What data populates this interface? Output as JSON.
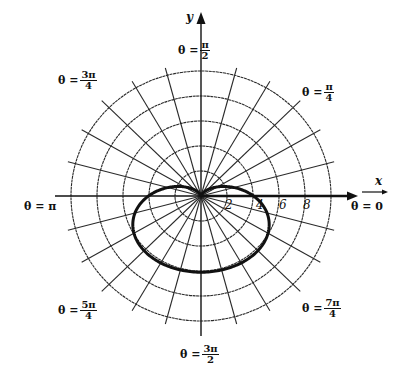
{
  "figure": {
    "type": "polar-graph",
    "axes": {
      "x_label": "x",
      "y_label": "y"
    },
    "radial_ticks": [
      "2",
      "4",
      "6",
      "8"
    ],
    "angle_labels": {
      "deg0": {
        "theta": "θ = 0",
        "prefix": "θ =",
        "num": "0",
        "den": ""
      },
      "deg45": {
        "prefix": "θ =",
        "num": "π",
        "den": "4"
      },
      "deg90": {
        "prefix": "θ =",
        "num": "π",
        "den": "2"
      },
      "deg135": {
        "prefix": "θ =",
        "num": "3π",
        "den": "4"
      },
      "deg180": {
        "theta": "θ = π"
      },
      "deg225": {
        "prefix": "θ =",
        "num": "5π",
        "den": "4"
      },
      "deg270": {
        "prefix": "θ =",
        "num": "3π",
        "den": "2"
      },
      "deg315": {
        "prefix": "θ =",
        "num": "7π",
        "den": "4"
      }
    },
    "colors": {
      "ink": "#111111",
      "grid": "#2a2a2a",
      "background": "#ffffff"
    }
  },
  "chart_data": {
    "type": "line",
    "title": "",
    "coordinate_system": "polar",
    "xlabel": "x",
    "ylabel": "y",
    "radial_grid": [
      2,
      4,
      6,
      8,
      10
    ],
    "radial_tick_labels": [
      "2",
      "4",
      "6",
      "8"
    ],
    "angular_grid_step_deg": 15,
    "angle_labels": [
      "θ = 0",
      "θ = π/4",
      "θ = π/2",
      "θ = 3π/4",
      "θ = π",
      "θ = 5π/4",
      "θ = 3π/2",
      "θ = 7π/4"
    ],
    "series": [
      {
        "name": "cardioid",
        "equation": "r = 3 - 3 sin θ",
        "theta": [
          "0",
          "π/4",
          "π/2",
          "3π/4",
          "π",
          "5π/4",
          "3π/2",
          "7π/4"
        ],
        "r": [
          3,
          0.88,
          0,
          0.88,
          3,
          5.12,
          6,
          5.12
        ]
      }
    ],
    "grid": true
  }
}
